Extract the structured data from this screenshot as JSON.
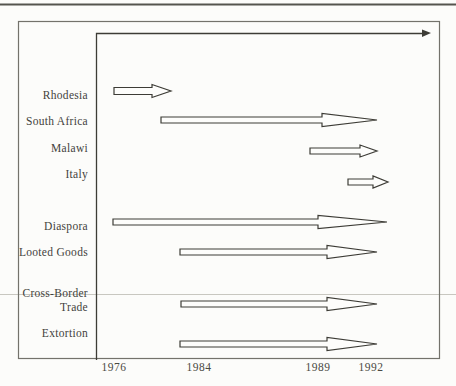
{
  "page": {
    "background": "#fcfcfa",
    "ink": "#3d3c36",
    "arrow_fill": "#fdfdfb",
    "top_rule_color": "#55544e",
    "faint_rule_color": "#c8c7c0",
    "frame_color": "#73726b"
  },
  "chart_data": {
    "type": "timeline",
    "title": "",
    "x_axis": {
      "ticks": [
        {
          "label": "1976",
          "x": 114
        },
        {
          "label": "1984",
          "x": 199
        },
        {
          "label": "1989",
          "x": 318
        },
        {
          "label": "1992",
          "x": 371
        }
      ]
    },
    "rows": [
      {
        "name": "Rhodesia",
        "approx_period": "1976 to c.1981",
        "label_lines": [
          {
            "text": "Rhodesia",
            "y": 95
          }
        ],
        "arrow": {
          "x1": 114,
          "x2": 171,
          "y": 91,
          "head_len": 19,
          "shaft_half": 3.5,
          "head_half": 6.5
        }
      },
      {
        "name": "South Africa",
        "approx_period": "c.1980 to 1992+",
        "label_lines": [
          {
            "text": "South Africa",
            "y": 121
          }
        ],
        "arrow": {
          "x1": 161,
          "x2": 377,
          "y": 120,
          "head_len": 55,
          "shaft_half": 3,
          "head_half": 6.5
        }
      },
      {
        "name": "Malawi",
        "approx_period": "c.1989 to 1992+",
        "label_lines": [
          {
            "text": "Malawi",
            "y": 148
          }
        ],
        "arrow": {
          "x1": 310,
          "x2": 377,
          "y": 151,
          "head_len": 17,
          "shaft_half": 3,
          "head_half": 6
        }
      },
      {
        "name": "Italy",
        "approx_period": "c.1991 to 1992+",
        "label_lines": [
          {
            "text": "Italy",
            "y": 174
          }
        ],
        "arrow": {
          "x1": 348,
          "x2": 388,
          "y": 182,
          "head_len": 15,
          "shaft_half": 3,
          "head_half": 6
        }
      },
      {
        "name": "Diaspora",
        "approx_period": "1976 to 1992+",
        "label_lines": [
          {
            "text": "Diaspora",
            "y": 226
          }
        ],
        "arrow": {
          "x1": 113,
          "x2": 387,
          "y": 222,
          "head_len": 69,
          "shaft_half": 3,
          "head_half": 6.5
        }
      },
      {
        "name": "Looted Goods",
        "approx_period": "c.1982 to 1992+",
        "label_lines": [
          {
            "text": "Looted Goods",
            "y": 252
          }
        ],
        "arrow": {
          "x1": 180,
          "x2": 377,
          "y": 252,
          "head_len": 50,
          "shaft_half": 3,
          "head_half": 6.5
        }
      },
      {
        "name": "Cross-Border Trade",
        "approx_period": "c.1982 to 1992+",
        "label_lines": [
          {
            "text": "Cross-Border",
            "y": 293
          },
          {
            "text": "Trade",
            "y": 307
          }
        ],
        "arrow": {
          "x1": 181,
          "x2": 377,
          "y": 304,
          "head_len": 50,
          "shaft_half": 3,
          "head_half": 6.5
        }
      },
      {
        "name": "Extortion",
        "approx_period": "c.1982 to 1992+",
        "label_lines": [
          {
            "text": "Extortion",
            "y": 333
          }
        ],
        "arrow": {
          "x1": 180,
          "x2": 377,
          "y": 344,
          "head_len": 50,
          "shaft_half": 3,
          "head_half": 6.5
        }
      }
    ],
    "axis_geometry": {
      "y_axis_x": 96,
      "top_line_y": 33,
      "top_arrow_tip_x": 431,
      "frame": {
        "left": 18,
        "top": 21,
        "right": 439,
        "bottom": 358
      },
      "label_right_edge_x": 88,
      "tick_label_top_y": 361,
      "top_rule_y": 4,
      "faint_rule_y": 294
    }
  }
}
